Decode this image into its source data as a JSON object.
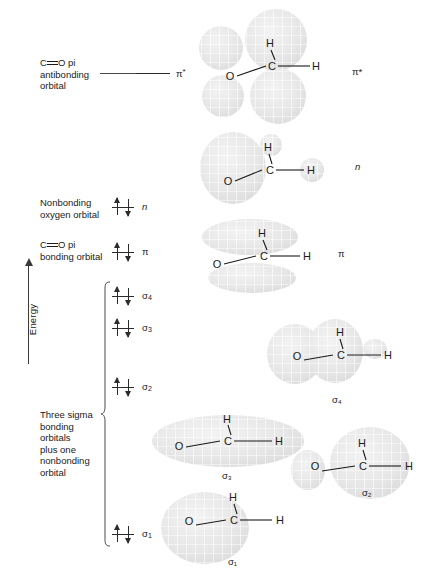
{
  "figure": {
    "axis": {
      "label": "Energy",
      "direction": "up"
    }
  },
  "labels": {
    "antibonding": {
      "line1": "C",
      "bond": "═",
      "line1b": "O pi",
      "line2": "antibonding",
      "line3": "orbital"
    },
    "nonbonding": {
      "line1": "Nonbonding",
      "line2": "oxygen orbital"
    },
    "pi_bonding": {
      "line1": "C",
      "bond": "═",
      "line1b": "O pi",
      "line2": "bonding orbital"
    },
    "sigma_group": {
      "line1": "Three sigma",
      "line2": "bonding",
      "line3": "orbitals",
      "line4": "plus one",
      "line5": "nonbonding",
      "line6": "orbital"
    }
  },
  "levels": [
    {
      "id": "pi-star",
      "symbol": "π",
      "superscript": "*",
      "italic": false,
      "electrons": 0,
      "occupancy": "empty"
    },
    {
      "id": "n",
      "symbol": "n",
      "superscript": "",
      "italic": true,
      "electrons": 2,
      "occupancy": "paired"
    },
    {
      "id": "pi",
      "symbol": "π",
      "superscript": "",
      "italic": false,
      "electrons": 2,
      "occupancy": "paired"
    },
    {
      "id": "sigma-4",
      "symbol": "σ",
      "subscript": "4",
      "italic": false,
      "electrons": 2,
      "occupancy": "paired"
    },
    {
      "id": "sigma-3",
      "symbol": "σ",
      "subscript": "3",
      "italic": false,
      "electrons": 2,
      "occupancy": "paired"
    },
    {
      "id": "sigma-2",
      "symbol": "σ",
      "subscript": "2",
      "italic": false,
      "electrons": 2,
      "occupancy": "paired"
    },
    {
      "id": "sigma-1",
      "symbol": "σ",
      "subscript": "1",
      "italic": false,
      "electrons": 2,
      "occupancy": "paired"
    }
  ],
  "orbital_pictures": [
    {
      "id": "pi-star-orbital",
      "tag": "π*",
      "tag_position": "right",
      "atoms": {
        "o": "O",
        "c": "C",
        "h1": "H",
        "h2": "H"
      },
      "lobes": 4,
      "description": "Four lobes above and below the C and O atoms"
    },
    {
      "id": "n-orbital",
      "tag": "n",
      "tag_position": "right",
      "atoms": {
        "o": "O",
        "c": "C",
        "h1": "H",
        "h2": "H"
      },
      "lobes": 2,
      "description": "Large lobe on oxygen, small lobe on hydrogen"
    },
    {
      "id": "pi-orbital",
      "tag": "π",
      "tag_position": "right",
      "atoms": {
        "o": "O",
        "c": "C",
        "h1": "H",
        "h2": "H"
      },
      "lobes": 2,
      "description": "Two elongated lobes above and below the C═O axis"
    },
    {
      "id": "sigma-4-orbital",
      "tag": "σ₄",
      "tag_position": "below",
      "atoms": {
        "o": "O",
        "c": "C",
        "h1": "H",
        "h2": "H"
      },
      "lobes": 3,
      "description": "Two large lobes around O and C plus small lobe on H"
    },
    {
      "id": "sigma-3-orbital",
      "tag": "σ₃",
      "tag_position": "below",
      "atoms": {
        "o": "O",
        "c": "C",
        "h1": "H",
        "h2": "H"
      },
      "lobes": 1,
      "description": "One large flattened lobe spanning the whole molecule"
    },
    {
      "id": "sigma-2-orbital",
      "tag": "σ₂",
      "tag_position": "below",
      "atoms": {
        "o": "O",
        "c": "C",
        "h1": "H",
        "h2": "H"
      },
      "lobes": 2,
      "description": "Large lobe on carbon, small lobe on oxygen"
    },
    {
      "id": "sigma-1-orbital",
      "tag": "σ₁",
      "tag_position": "below",
      "atoms": {
        "o": "O",
        "c": "C",
        "h1": "H",
        "h2": "H"
      },
      "lobes": 1,
      "description": "One large lobe centered on oxygen"
    }
  ],
  "colors": {
    "ink": "#1a1a1a",
    "line": "#2b2b2b",
    "lobe_fill": "#e9e9e9",
    "lobe_mesh": "#ffffff",
    "background": "#ffffff"
  }
}
